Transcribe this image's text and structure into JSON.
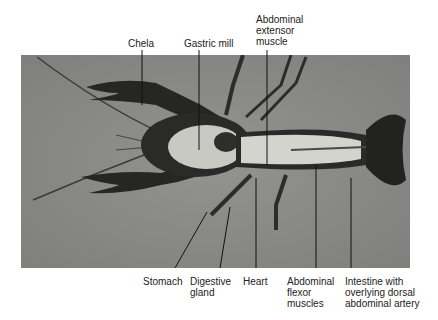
{
  "figure": {
    "background_color": "#8a8a88",
    "labels_top": [
      {
        "id": "chela",
        "text": "Chela"
      },
      {
        "id": "gastric-mill",
        "text": "Gastric mill"
      },
      {
        "id": "abdominal-extensor-muscle",
        "text": "Abdominal\nextensor\nmuscle"
      }
    ],
    "labels_bottom": [
      {
        "id": "stomach",
        "text": "Stomach"
      },
      {
        "id": "digestive-gland",
        "text": "Digestive\ngland"
      },
      {
        "id": "heart",
        "text": "Heart"
      },
      {
        "id": "abdominal-flexor-muscles",
        "text": "Abdominal\nflexor\nmuscles"
      },
      {
        "id": "intestine",
        "text": "Intestine with\noverlying dorsal\nabdominal artery"
      }
    ]
  }
}
